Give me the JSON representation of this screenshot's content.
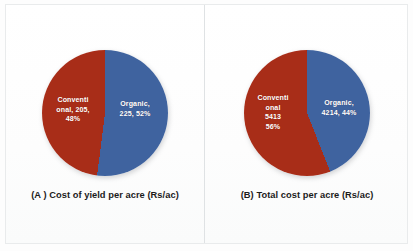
{
  "figure": {
    "background_color": "#fdfdfd",
    "divider_color": "#dfe2e4"
  },
  "colors": {
    "conventional": "#A82D18",
    "organic": "#3F639F",
    "label_text": "#ffffff",
    "caption_text": "#1b1b1b"
  },
  "panels": [
    {
      "id": "A",
      "caption": "(A ) Cost of yield per acre (Rs/ac)",
      "conventional_label": "Conventi\nonal, 205,\n48%",
      "organic_label": "Organic,\n225, 52%"
    },
    {
      "id": "B",
      "caption": "(B) Total cost per acre (Rs/ac)",
      "conventional_label": "Conventi\nonal\n5413\n56%",
      "organic_label": "Organic,\n4214, 44%"
    }
  ],
  "chart_data": [
    {
      "type": "pie",
      "title": "(A ) Cost of yield per acre (Rs/ac)",
      "labels": [
        "Organic",
        "Conventional"
      ],
      "values": [
        225,
        205
      ],
      "percentages": [
        52,
        48
      ],
      "colors": [
        "#3F639F",
        "#A82D18"
      ],
      "units": "Rs/ac",
      "legend": "none",
      "data_labels": [
        "Organic, 225, 52%",
        "Conventional, 205, 48%"
      ],
      "start_angle_deg": 0,
      "direction": "clockwise"
    },
    {
      "type": "pie",
      "title": "(B) Total cost per acre (Rs/ac)",
      "labels": [
        "Organic",
        "Conventional"
      ],
      "values": [
        4214,
        5413
      ],
      "percentages": [
        44,
        56
      ],
      "colors": [
        "#3F639F",
        "#A82D18"
      ],
      "units": "Rs/ac",
      "legend": "none",
      "data_labels": [
        "Organic, 4214, 44%",
        "Conventional 5413 56%"
      ],
      "start_angle_deg": 0,
      "direction": "clockwise"
    }
  ]
}
